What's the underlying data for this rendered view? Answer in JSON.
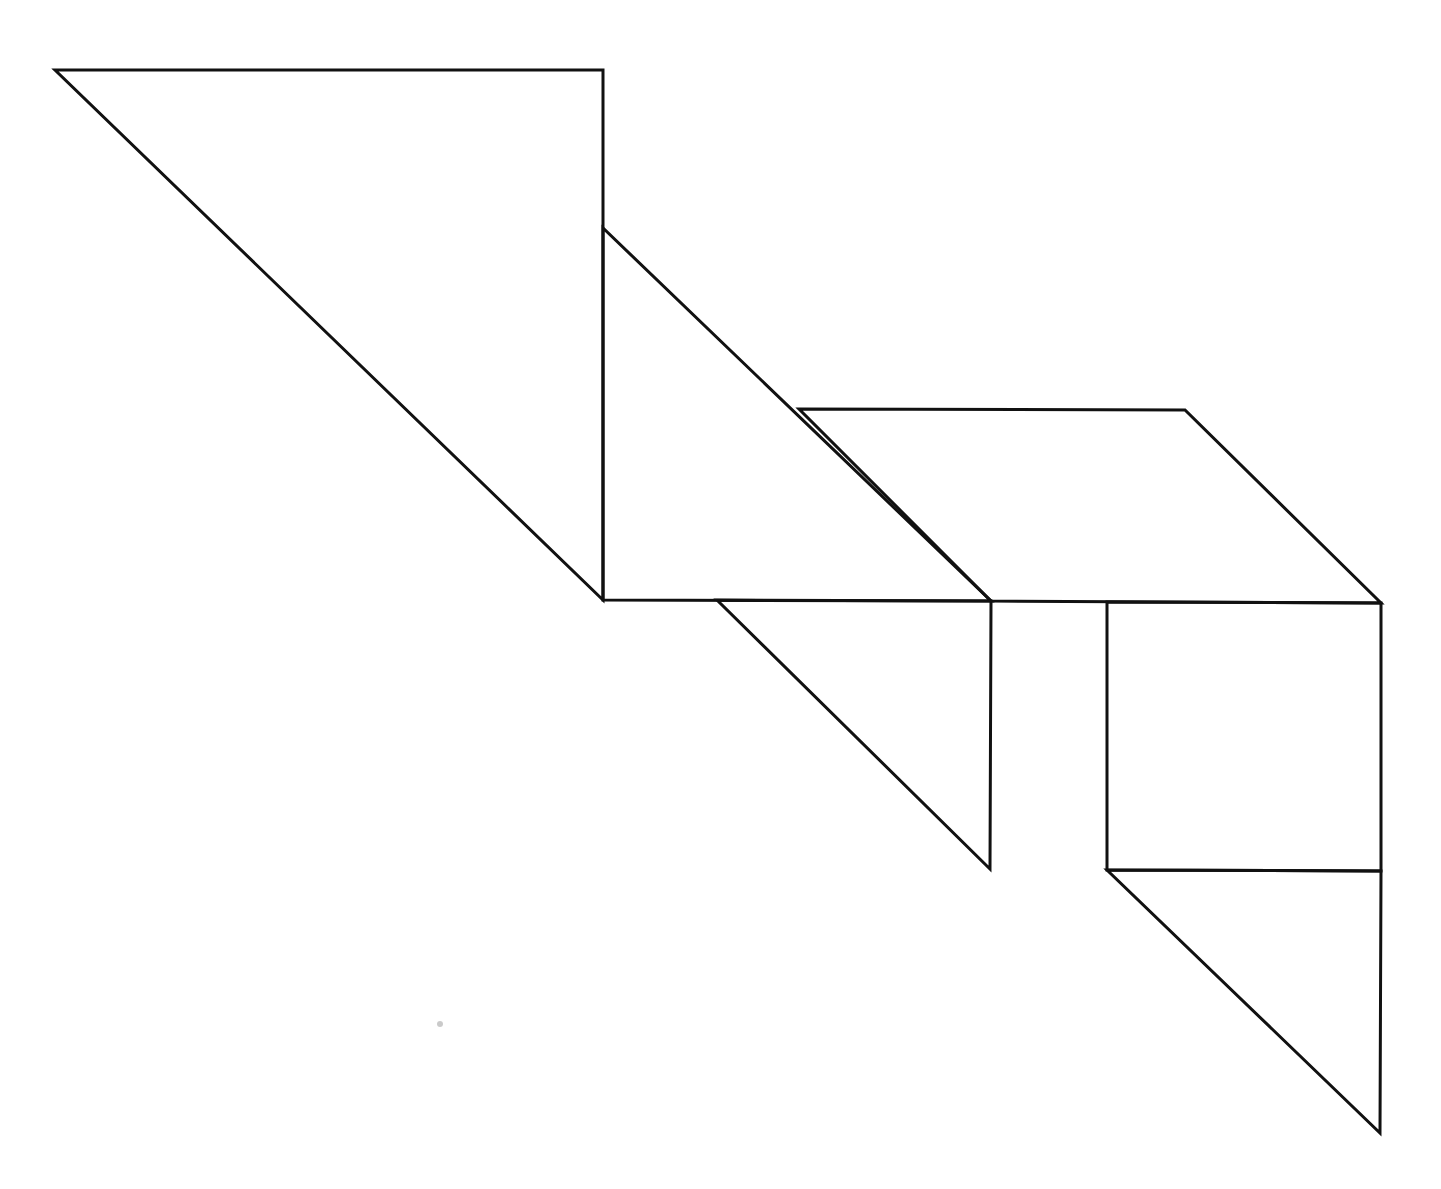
{
  "figure": {
    "type": "tangram-outline",
    "width": 1441,
    "height": 1189,
    "background": "#ffffff",
    "stroke_color": "#111111",
    "stroke_width": 3,
    "pieces": [
      {
        "name": "large-triangle",
        "points": [
          [
            55,
            70
          ],
          [
            603,
            70
          ],
          [
            603,
            600
          ]
        ]
      },
      {
        "name": "medium-triangle",
        "points": [
          [
            603,
            228
          ],
          [
            603,
            600
          ],
          [
            991,
            601
          ]
        ]
      },
      {
        "name": "parallelogram",
        "points": [
          [
            799,
            409
          ],
          [
            1185,
            410
          ],
          [
            1381,
            603
          ],
          [
            991,
            601
          ]
        ]
      },
      {
        "name": "small-triangle-left",
        "points": [
          [
            717,
            600
          ],
          [
            991,
            601
          ],
          [
            990,
            869
          ]
        ]
      },
      {
        "name": "square",
        "points": [
          [
            1107,
            602
          ],
          [
            1381,
            603
          ],
          [
            1381,
            871
          ],
          [
            1107,
            870
          ]
        ]
      },
      {
        "name": "small-triangle-bottom",
        "points": [
          [
            1107,
            870
          ],
          [
            1381,
            871
          ],
          [
            1380,
            1133
          ]
        ]
      }
    ],
    "artifacts": [
      {
        "name": "scan-speck",
        "cx": 440,
        "cy": 1024,
        "r": 3
      }
    ]
  }
}
